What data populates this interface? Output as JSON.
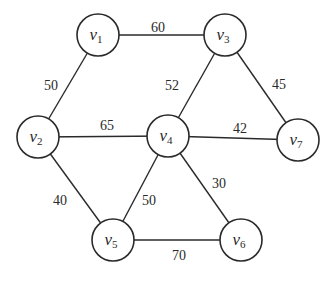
{
  "graph": {
    "type": "undirected-weighted",
    "colors": {
      "stroke": "#2a2a2a",
      "background": "#ffffff",
      "node_fill": "#ffffff"
    },
    "node_radius": 21,
    "nodes": [
      {
        "id": "v1",
        "base": "v",
        "sub": "1",
        "x": 98,
        "y": 35
      },
      {
        "id": "v2",
        "base": "v",
        "sub": "2",
        "x": 38,
        "y": 137
      },
      {
        "id": "v3",
        "base": "v",
        "sub": "3",
        "x": 225,
        "y": 35
      },
      {
        "id": "v4",
        "base": "v",
        "sub": "4",
        "x": 168,
        "y": 136
      },
      {
        "id": "v5",
        "base": "v",
        "sub": "5",
        "x": 113,
        "y": 240
      },
      {
        "id": "v6",
        "base": "v",
        "sub": "6",
        "x": 241,
        "y": 240
      },
      {
        "id": "v7",
        "base": "v",
        "sub": "7",
        "x": 298,
        "y": 140
      }
    ],
    "edges": [
      {
        "from": "v1",
        "to": "v3",
        "weight": "60",
        "label_x": 158,
        "label_y": 32
      },
      {
        "from": "v1",
        "to": "v2",
        "weight": "50",
        "label_x": 51,
        "label_y": 90
      },
      {
        "from": "v2",
        "to": "v4",
        "weight": "65",
        "label_x": 107,
        "label_y": 130
      },
      {
        "from": "v3",
        "to": "v4",
        "weight": "52",
        "label_x": 172,
        "label_y": 90
      },
      {
        "from": "v3",
        "to": "v7",
        "weight": "45",
        "label_x": 279,
        "label_y": 89
      },
      {
        "from": "v4",
        "to": "v7",
        "weight": "42",
        "label_x": 240,
        "label_y": 133
      },
      {
        "from": "v2",
        "to": "v5",
        "weight": "40",
        "label_x": 60,
        "label_y": 205
      },
      {
        "from": "v4",
        "to": "v5",
        "weight": "50",
        "label_x": 149,
        "label_y": 205
      },
      {
        "from": "v4",
        "to": "v6",
        "weight": "30",
        "label_x": 219,
        "label_y": 188
      },
      {
        "from": "v5",
        "to": "v6",
        "weight": "70",
        "label_x": 179,
        "label_y": 260
      }
    ]
  }
}
